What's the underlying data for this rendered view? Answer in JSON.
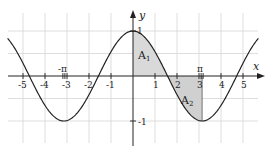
{
  "chart_data": {
    "type": "line",
    "title": "",
    "function": "y = cos(x)",
    "xlabel": "x",
    "ylabel": "y",
    "xlim": [
      -5.7,
      5.7
    ],
    "ylim": [
      -1.45,
      1.45
    ],
    "grid": true,
    "x_ticks": [
      -5,
      -4,
      -3,
      -2,
      -1,
      1,
      2,
      3,
      4,
      5
    ],
    "x_tick_labels": [
      "-5",
      "-4",
      "-3",
      "-2",
      "-1",
      "1",
      "2",
      "3",
      "4",
      "5"
    ],
    "y_ticks": [
      1,
      -1
    ],
    "y_tick_labels": [
      "1",
      "-1"
    ],
    "special_ticks": [
      {
        "x": -3.14159,
        "label": "-π"
      },
      {
        "x": 3.14159,
        "label": "π"
      }
    ],
    "series": [
      {
        "name": "cos(x)",
        "x": [
          -5.7,
          -4.71,
          -3.14,
          -1.57,
          0,
          1.57,
          3.14,
          4.71,
          5.7
        ],
        "values": [
          0.83,
          0,
          -1,
          0,
          1,
          0,
          -1,
          0,
          0.83
        ]
      }
    ],
    "shaded_regions": [
      {
        "name": "A1",
        "x_from": 0,
        "x_to": 1.5708,
        "label": "A",
        "subscript": "1"
      },
      {
        "name": "A2",
        "x_from": 1.5708,
        "x_to": 3.14159,
        "label": "A",
        "subscript": "2"
      }
    ],
    "colors": {
      "curve": "#222222",
      "shade": "#d9d9d9",
      "grid": "#d6d6d6",
      "axis": "#222222"
    }
  },
  "labels": {
    "x_axis": "x",
    "y_axis": "y",
    "y_one": "1",
    "y_minus_one": "-1",
    "neg_pi": "-π",
    "pi": "π",
    "a1_main": "A",
    "a1_sub": "1",
    "a2_main": "A",
    "a2_sub": "2",
    "xt": [
      "-5",
      "-4",
      "-3",
      "-2",
      "-1",
      "1",
      "2",
      "3",
      "4",
      "5"
    ]
  }
}
